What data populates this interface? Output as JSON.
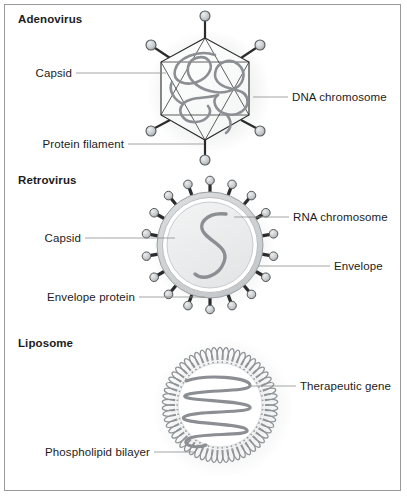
{
  "figure": {
    "background_color": "#ffffff",
    "border_color": "#9a9a9a",
    "width": 407,
    "height": 500
  },
  "palette": {
    "text": "#1c1c1c",
    "leader_line": "#8d8d8d",
    "outline_dark": "#2b2b2b",
    "nucleic_acid_gray": "#8b8f93",
    "envelope_fill": "#d3d5d7",
    "core_fill": "#eceded",
    "lipid_gray": "#8f9396",
    "knob_fill": "#c9cbcd"
  },
  "panels": [
    {
      "id": "adenovirus",
      "title": "Adenovirus",
      "callouts": [
        {
          "id": "capsid",
          "label": "Capsid",
          "side": "left"
        },
        {
          "id": "dna-chromosome",
          "label": "DNA chromosome",
          "side": "right"
        },
        {
          "id": "protein-filament",
          "label": "Protein filament",
          "side": "left"
        }
      ],
      "structure": {
        "shape": "hexagonal capsid",
        "filament_count": 6,
        "contents": "DNA chromosome"
      }
    },
    {
      "id": "retrovirus",
      "title": "Retrovirus",
      "callouts": [
        {
          "id": "capsid",
          "label": "Capsid",
          "side": "left"
        },
        {
          "id": "rna-chromosome",
          "label": "RNA chromosome",
          "side": "right"
        },
        {
          "id": "envelope",
          "label": "Envelope",
          "side": "right"
        },
        {
          "id": "envelope-protein",
          "label": "Envelope protein",
          "side": "left"
        }
      ],
      "structure": {
        "shape": "spherical enveloped capsid",
        "spike_count": 18,
        "contents": "RNA chromosome"
      }
    },
    {
      "id": "liposome",
      "title": "Liposome",
      "callouts": [
        {
          "id": "therapeutic-gene",
          "label": "Therapeutic gene",
          "side": "right"
        },
        {
          "id": "phospholipid-bilayer",
          "label": "Phospholipid bilayer",
          "side": "left"
        }
      ],
      "structure": {
        "shape": "spherical lipid vesicle",
        "lipid_head_count": 58,
        "contents": "Therapeutic gene"
      }
    }
  ]
}
